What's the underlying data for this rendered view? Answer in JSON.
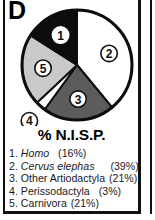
{
  "panel": {
    "letter": "D"
  },
  "chart_title": "% N.I.S.P.",
  "chart_data": {
    "type": "pie",
    "title": "% N.I.S.P.",
    "xlabel": "",
    "ylabel": "",
    "legend_position": "below",
    "grid": false,
    "start_angle_deg": 0,
    "direction": "clockwise",
    "categories": [
      "Homo",
      "Cervus elephas",
      "Other Artiodactyla",
      "Perissodactyla",
      "Carnivora"
    ],
    "values": [
      16,
      39,
      21,
      3,
      21
    ],
    "value_labels": [
      "(16%)",
      "(39%)",
      "(21%)",
      "(3%)",
      "(21%)"
    ],
    "units": "percent",
    "slice_order_clockwise_from_12": [
      2,
      3,
      4,
      5,
      1
    ],
    "slices": [
      {
        "number": "1",
        "marker": "①",
        "label": "Homo",
        "italic": true,
        "value": 16,
        "percent_text": "(16%)",
        "fill": "#0d0d0d",
        "marker_fill": "#ffffff",
        "marker_text_color": "#0d0d0d",
        "marker_stroke": "#ffffff"
      },
      {
        "number": "2",
        "marker": "②",
        "label": "Cervus elephas",
        "italic": true,
        "value": 39,
        "percent_text": "(39%)",
        "fill": "#ffffff",
        "marker_fill": "#ffffff",
        "marker_text_color": "#111111",
        "marker_stroke": "#111111"
      },
      {
        "number": "3",
        "marker": "③",
        "label": "Other Artiodactyla",
        "italic": false,
        "value": 21,
        "percent_text": "(21%)",
        "fill": "#5c5c5c",
        "marker_fill": "#ffffff",
        "marker_text_color": "#111111",
        "marker_stroke": "#111111"
      },
      {
        "number": "4",
        "marker": "④",
        "label": "Perissodactyla",
        "italic": false,
        "value": 3,
        "percent_text": "(3%)",
        "fill": "#ffffff",
        "marker_fill": "#ffffff",
        "marker_text_color": "#111111",
        "marker_stroke": "#111111"
      },
      {
        "number": "5",
        "marker": "⑤",
        "label": "Carnivora",
        "italic": false,
        "value": 21,
        "percent_text": "(21%)",
        "fill": "#c9c9c9",
        "marker_fill": "#ffffff",
        "marker_text_color": "#111111",
        "marker_stroke": "#111111"
      }
    ],
    "colors": {
      "outline": "#0d0d0d",
      "black_slice": "#0d0d0d",
      "white_slice": "#ffffff",
      "dark_gray_slice": "#5c5c5c",
      "light_gray_slice": "#c9c9c9",
      "frame": "#111111"
    }
  },
  "legend": {
    "items": [
      {
        "num": "1.",
        "name": "Homo",
        "pct": "(16%)"
      },
      {
        "num": "2.",
        "name": "Cervus elephas",
        "pct": "(39%)"
      },
      {
        "num": "3.",
        "name": "Other Artiodactyla",
        "pct": "(21%)"
      },
      {
        "num": "4.",
        "name": "Perissodactyla",
        "pct": "(3%)"
      },
      {
        "num": "5.",
        "name": "Carnivora",
        "pct": "(21%)"
      }
    ]
  }
}
